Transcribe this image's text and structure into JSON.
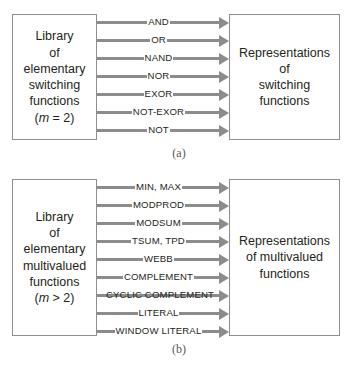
{
  "figure": {
    "panels": [
      {
        "id": "a",
        "caption": "(a)",
        "left_box": {
          "lines": [
            "Library",
            "of",
            "elementary",
            "switching",
            "functions"
          ],
          "parameter": "(m = 2)",
          "parameter_symbol": "m",
          "parameter_rest": " = 2)",
          "parameter_prefix": "("
        },
        "right_box": {
          "lines": [
            "Representations",
            "of",
            "switching",
            "functions"
          ]
        },
        "arrows": [
          {
            "label": "AND"
          },
          {
            "label": "OR"
          },
          {
            "label": "NAND"
          },
          {
            "label": "NOR"
          },
          {
            "label": "EXOR"
          },
          {
            "label": "NOT-EXOR"
          },
          {
            "label": "NOT"
          }
        ]
      },
      {
        "id": "b",
        "caption": "(b)",
        "left_box": {
          "lines": [
            "Library",
            "of",
            "elementary",
            "multivalued",
            "functions"
          ],
          "parameter": "(m > 2)",
          "parameter_symbol": "m",
          "parameter_rest": " > 2)",
          "parameter_prefix": "("
        },
        "right_box": {
          "lines": [
            "Representations",
            "of multivalued",
            "functions"
          ]
        },
        "arrows": [
          {
            "label": "MIN,  MAX"
          },
          {
            "label": "MODPROD"
          },
          {
            "label": "MODSUM"
          },
          {
            "label": "TSUM, TPD"
          },
          {
            "label": "WEBB"
          },
          {
            "label": "COMPLEMENT"
          },
          {
            "label": "CYCLIC COMPLEMENT"
          },
          {
            "label": "LITERAL"
          },
          {
            "label": "WINDOW LITERAL"
          }
        ]
      }
    ]
  },
  "colors": {
    "arrow": "#8c8c8c",
    "box_border": "#8f8f8f",
    "text": "#231f20",
    "caption": "#58595b",
    "background": "#ffffff"
  }
}
